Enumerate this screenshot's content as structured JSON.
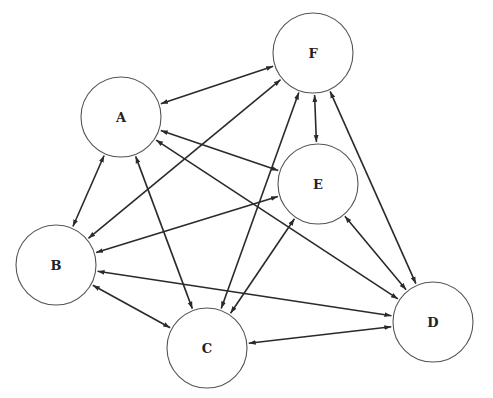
{
  "diagram": {
    "type": "directed-graph",
    "node_radius": 40,
    "nodes": [
      {
        "id": "A",
        "label": "A",
        "x": 121,
        "y": 117
      },
      {
        "id": "B",
        "label": "B",
        "x": 56,
        "y": 265
      },
      {
        "id": "C",
        "label": "C",
        "x": 207,
        "y": 348
      },
      {
        "id": "D",
        "label": "D",
        "x": 433,
        "y": 322
      },
      {
        "id": "E",
        "label": "E",
        "x": 318,
        "y": 184
      },
      {
        "id": "F",
        "label": "F",
        "x": 313,
        "y": 53
      }
    ],
    "edges": [
      {
        "from": "A",
        "to": "F",
        "bidirectional": true
      },
      {
        "from": "A",
        "to": "B",
        "bidirectional": true
      },
      {
        "from": "A",
        "to": "C",
        "bidirectional": true
      },
      {
        "from": "A",
        "to": "E",
        "bidirectional": true
      },
      {
        "from": "A",
        "to": "D",
        "bidirectional": true
      },
      {
        "from": "F",
        "to": "B",
        "bidirectional": true
      },
      {
        "from": "F",
        "to": "E",
        "bidirectional": true
      },
      {
        "from": "F",
        "to": "C",
        "bidirectional": true
      },
      {
        "from": "F",
        "to": "D",
        "bidirectional": true
      },
      {
        "from": "E",
        "to": "B",
        "bidirectional": true
      },
      {
        "from": "E",
        "to": "C",
        "bidirectional": true
      },
      {
        "from": "E",
        "to": "D",
        "bidirectional": true
      },
      {
        "from": "B",
        "to": "C",
        "bidirectional": true
      },
      {
        "from": "B",
        "to": "D",
        "bidirectional": true
      },
      {
        "from": "C",
        "to": "D",
        "bidirectional": true
      }
    ]
  }
}
